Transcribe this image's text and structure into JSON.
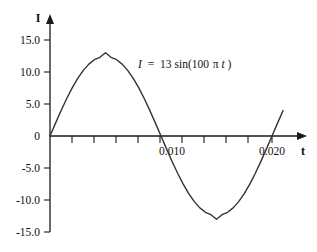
{
  "chart_data": {
    "type": "line",
    "title": "",
    "subtitle": "",
    "xlabel": "t",
    "ylabel": "I",
    "annotation": "I = 13sin(100πt)",
    "annotation_parts": {
      "symbol": "I",
      "equals": "=",
      "amplitude": "13",
      "func": "sin(100",
      "pi": "π",
      "var": "t",
      "close": ")"
    },
    "equation": {
      "amplitude": 13,
      "angular_frequency": "100π",
      "form": "I = 13sin(100πt)"
    },
    "grid": false,
    "legend": "none",
    "xlim": [
      0,
      0.0213
    ],
    "ylim": [
      -15.5,
      16.5
    ],
    "x_tick_labels": [
      "0.010",
      "0.020"
    ],
    "x_tick_values": [
      0.01,
      0.02
    ],
    "x_minor_tick_step": 0.002,
    "y_tick_labels": [
      "15.0",
      "10.0",
      "5.0",
      "0",
      "-5.0",
      "-10.0",
      "-15.0"
    ],
    "y_tick_values": [
      15,
      10,
      5,
      0,
      -5,
      -10,
      -15
    ],
    "series": [
      {
        "name": "I = 13sin(100πt)",
        "period": 0.02,
        "peak": {
          "t": 0.005,
          "I": 13
        },
        "trough": {
          "t": 0.015,
          "I": -13
        },
        "zero_crossings": [
          0,
          0.01,
          0.02
        ],
        "x": [
          0.0,
          0.0005,
          0.001,
          0.0015,
          0.002,
          0.0025,
          0.003,
          0.0035,
          0.004,
          0.0045,
          0.005,
          0.0055,
          0.006,
          0.0065,
          0.007,
          0.0075,
          0.008,
          0.0085,
          0.009,
          0.0095,
          0.01,
          0.0105,
          0.011,
          0.0115,
          0.012,
          0.0125,
          0.013,
          0.0135,
          0.014,
          0.0145,
          0.015,
          0.0155,
          0.016,
          0.0165,
          0.017,
          0.0175,
          0.018,
          0.0185,
          0.019,
          0.0195,
          0.02,
          0.0205,
          0.021
        ],
        "values": [
          0.0,
          2.01,
          3.97,
          5.82,
          7.51,
          9.0,
          10.25,
          11.23,
          11.92,
          12.3,
          13.0,
          12.3,
          11.92,
          11.23,
          10.25,
          9.0,
          7.51,
          5.82,
          3.97,
          2.01,
          0.0,
          -2.01,
          -3.97,
          -5.82,
          -7.51,
          -9.0,
          -10.25,
          -11.23,
          -11.92,
          -12.3,
          -13.0,
          -12.3,
          -11.92,
          -11.23,
          -10.25,
          -9.0,
          -7.51,
          -5.82,
          -3.97,
          -2.01,
          0.0,
          2.01,
          3.97
        ]
      }
    ],
    "colors": {
      "curve": "#333333",
      "axis": "#1a1a1a",
      "text": "#111111",
      "background": "#ffffff"
    }
  }
}
